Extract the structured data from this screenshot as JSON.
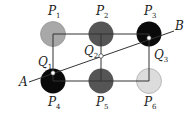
{
  "diagram": {
    "points": [
      {
        "id": "P1",
        "letter": "P",
        "sub": "1",
        "fill": "#a8a8a8",
        "cx": 53,
        "cy": 34
      },
      {
        "id": "P2",
        "letter": "P",
        "sub": "2",
        "fill": "#555555",
        "cx": 101,
        "cy": 34
      },
      {
        "id": "P3",
        "letter": "P",
        "sub": "3",
        "fill": "#0a0a0a",
        "cx": 149,
        "cy": 34
      },
      {
        "id": "P4",
        "letter": "P",
        "sub": "4",
        "fill": "#0a0a0a",
        "cx": 53,
        "cy": 81
      },
      {
        "id": "P5",
        "letter": "P",
        "sub": "5",
        "fill": "#555555",
        "cx": 101,
        "cy": 81
      },
      {
        "id": "P6",
        "letter": "P",
        "sub": "6",
        "fill": "#dcdcdc",
        "cx": 149,
        "cy": 81
      }
    ],
    "intersections": [
      {
        "id": "Q1",
        "letter": "Q",
        "sub": "1"
      },
      {
        "id": "Q2",
        "letter": "Q",
        "sub": "2"
      },
      {
        "id": "Q3",
        "letter": "Q",
        "sub": "3"
      }
    ],
    "line": {
      "start_label": "A",
      "end_label": "B"
    }
  }
}
